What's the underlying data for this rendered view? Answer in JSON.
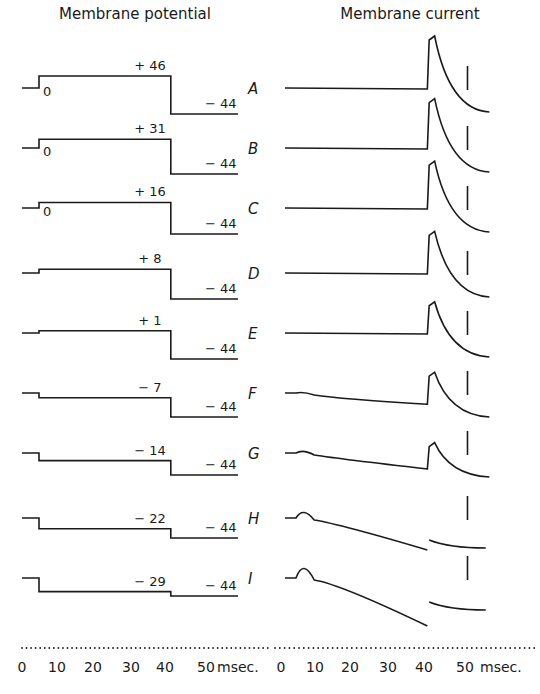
{
  "chart_data": {
    "type": "line",
    "panels": [
      {
        "title": "Membrane potential",
        "x_unit": "msec.",
        "x_ticks": [
          "0",
          "10",
          "20",
          "30",
          "40",
          "50"
        ]
      },
      {
        "title": "Membrane current",
        "x_unit": "msec.",
        "x_ticks": [
          "0",
          "10",
          "20",
          "30",
          "40",
          "50"
        ]
      }
    ],
    "rows": [
      {
        "letter": "A",
        "step_mv": "+46",
        "hold_mv": "-44",
        "start_label": "0",
        "pre_level": "-",
        "peak_current": 1.0,
        "early_bump": 0.0,
        "tail_offset": 0.0
      },
      {
        "letter": "B",
        "step_mv": "+31",
        "hold_mv": "-44",
        "start_label": "0",
        "peak_current": 0.95,
        "early_bump": 0.0,
        "tail_offset": 0.0
      },
      {
        "letter": "C",
        "step_mv": "+16",
        "hold_mv": "-44",
        "start_label": "0",
        "peak_current": 0.9,
        "early_bump": 0.0,
        "tail_offset": 0.0
      },
      {
        "letter": "D",
        "step_mv": "+8",
        "hold_mv": "-44",
        "start_label": "",
        "peak_current": 0.8,
        "early_bump": 0.0,
        "tail_offset": 0.0
      },
      {
        "letter": "E",
        "step_mv": "+1",
        "hold_mv": "-44",
        "start_label": "",
        "peak_current": 0.6,
        "early_bump": 0.0,
        "tail_offset": 0.0
      },
      {
        "letter": "F",
        "step_mv": "-7",
        "hold_mv": "-44",
        "start_label": "",
        "peak_current": 0.4,
        "early_bump": 0.02,
        "tail_offset": 0.0
      },
      {
        "letter": "G",
        "step_mv": "-14",
        "hold_mv": "-44",
        "start_label": "",
        "peak_current": 0.2,
        "early_bump": 0.05,
        "tail_offset": 0.0
      },
      {
        "letter": "H",
        "step_mv": "-22",
        "hold_mv": "-44",
        "start_label": "",
        "peak_current": 0.05,
        "early_bump": 0.15,
        "tail_offset": 0.1
      },
      {
        "letter": "I",
        "step_mv": "-29",
        "hold_mv": "-44",
        "start_label": "",
        "peak_current": 0.0,
        "early_bump": 0.25,
        "tail_offset": 0.15
      }
    ],
    "step_duration_ms": [
      0,
      40
    ],
    "marker_time_ms": 50,
    "xlabel": "msec.",
    "xlim": [
      0,
      55
    ]
  }
}
